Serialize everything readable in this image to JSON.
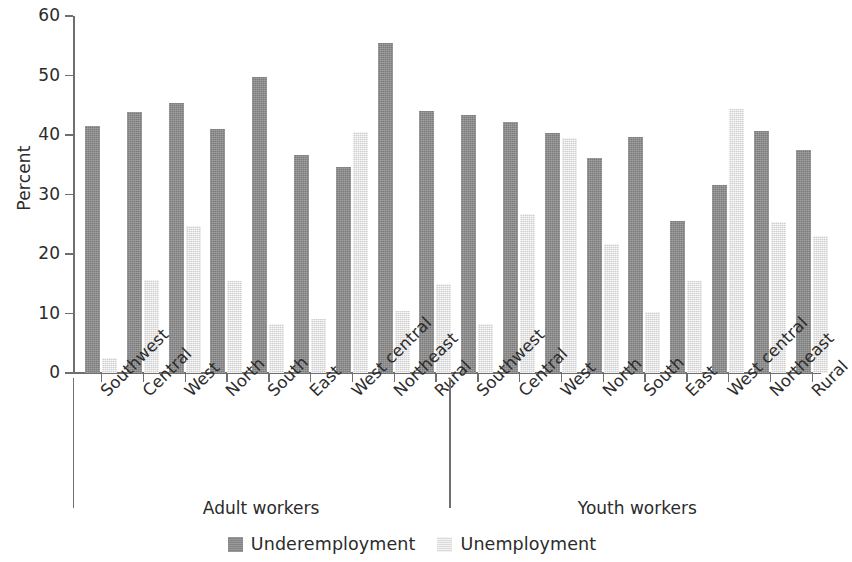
{
  "chart_data": {
    "type": "bar",
    "title": "",
    "xlabel": "",
    "ylabel": "Percent",
    "ylim": [
      0,
      60
    ],
    "yticks": [
      0,
      10,
      20,
      30,
      40,
      50,
      60
    ],
    "ytick_labels": [
      "0",
      "10",
      "20",
      "30",
      "40",
      "50",
      "60"
    ],
    "grid": false,
    "legend_position": "bottom-center",
    "legend": [
      "Underemployment",
      "Unemployment"
    ],
    "colors": {
      "underemployment": "#8b8b8b",
      "unemployment": "#e3e3e3",
      "axis": "#6f6f6f",
      "text": "#2b2b2b",
      "background": "#ffffff"
    },
    "groups": [
      {
        "name": "Adult workers",
        "categories": [
          "Southwest",
          "Central",
          "West",
          "North",
          "South",
          "East",
          "West central",
          "Northeast",
          "Rural"
        ],
        "series": [
          {
            "name": "Underemployment",
            "values": [
              41.5,
              43.8,
              45.3,
              41.0,
              49.7,
              36.7,
              34.6,
              55.5,
              44.0
            ]
          },
          {
            "name": "Unemployment",
            "values": [
              2.6,
              15.6,
              24.7,
              15.4,
              8.3,
              9.0,
              40.5,
              10.5,
              15.0
            ]
          }
        ]
      },
      {
        "name": "Youth workers",
        "categories": [
          "Southwest",
          "Central",
          "West",
          "North",
          "South",
          "East",
          "West central",
          "Northeast",
          "Rural"
        ],
        "series": [
          {
            "name": "Underemployment",
            "values": [
              43.4,
              42.2,
              40.4,
              36.1,
              39.7,
              25.5,
              31.6,
              40.7,
              37.5
            ]
          },
          {
            "name": "Unemployment",
            "values": [
              8.3,
              26.8,
              39.5,
              21.7,
              10.2,
              15.5,
              44.3,
              25.3,
              23.0
            ]
          }
        ]
      }
    ]
  }
}
